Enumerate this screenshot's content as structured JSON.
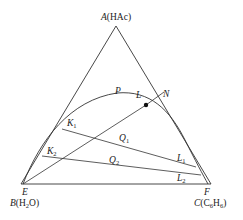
{
  "diagram": {
    "type": "ternary-phase-diagram",
    "vertices": {
      "top": {
        "letter": "A",
        "compound": "(HAc)"
      },
      "bottom_left": {
        "letter": "B",
        "compound_pre": "(H",
        "sub": "2",
        "compound_post": "O)"
      },
      "bottom_right": {
        "letter": "C",
        "compound_pre": "(C",
        "sub1": "6",
        "mid": "H",
        "sub2": "6",
        "compound_post": ")"
      }
    },
    "points": {
      "P": "P",
      "L": "L",
      "N": "N",
      "K1": {
        "letter": "K",
        "sub": "1"
      },
      "K2": {
        "letter": "K",
        "sub": "2"
      },
      "Q1": {
        "letter": "Q",
        "sub": "1"
      },
      "Q2": {
        "letter": "Q",
        "sub": "2"
      },
      "L1": {
        "letter": "L",
        "sub": "1"
      },
      "L2": {
        "letter": "L",
        "sub": "2"
      },
      "E": "E",
      "F": "F"
    },
    "colors": {
      "line": "#333333",
      "text": "#222222",
      "background": "#ffffff"
    }
  }
}
